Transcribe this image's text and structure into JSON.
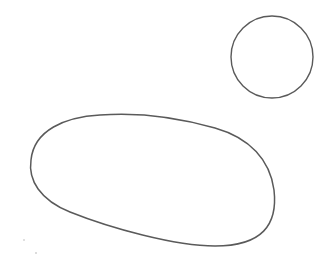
{
  "image": {
    "description": "Pencil sketch of a small circle and a large irregular oval on white paper",
    "background": "#ffffff",
    "stroke_color": "#5a5a5a",
    "shapes": [
      {
        "type": "circle",
        "label": "circle",
        "cx": 272,
        "cy": 57,
        "r": 41
      },
      {
        "type": "blob",
        "label": "oval-blob"
      }
    ],
    "specks": [
      {
        "x": 24,
        "y": 240
      },
      {
        "x": 36,
        "y": 253
      }
    ]
  }
}
